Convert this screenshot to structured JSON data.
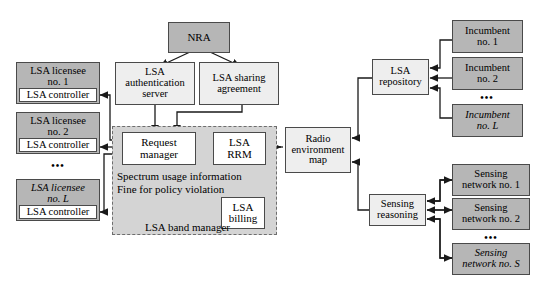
{
  "diagram": {
    "colors": {
      "shaded_fill": "#b6b6b6",
      "light_fill": "#eeeeee",
      "white_fill": "#ffffff",
      "band_region_fill": "#d4d4d4",
      "stroke": "#4a4a4a",
      "dashed_stroke": "#6d6d6d"
    },
    "nodes": {
      "nra": "NRA",
      "lsa_authentication_server": "LSA\nauthentication\nserver",
      "lsa_sharing_agreement": "LSA sharing\nagreement",
      "request_manager": "Request\nmanager",
      "lsa_rrm": "LSA\nRRM",
      "lsa_billing": "LSA\nbilling",
      "radio_environment_map": "Radio\nenvironment\nmap",
      "lsa_repository": "LSA\nrepository",
      "sensing_reasoning": "Sensing\nreasoning"
    },
    "licensees": [
      {
        "title": "LSA licensee\nno. 1",
        "controller": "LSA controller"
      },
      {
        "title": "LSA licensee\nno. 2",
        "controller": "LSA controller"
      },
      {
        "title": "LSA licensee\nno. L",
        "controller": "LSA controller"
      }
    ],
    "incumbents": [
      "Incumbent\nno. 1",
      "Incumbent\nno. 2",
      "Incumbent\nno. L"
    ],
    "sensing_networks": [
      "Sensing\nnetwork no. 1",
      "Sensing\nnetwork no. 2",
      "Sensing\nnetwork no. S"
    ],
    "band_region": {
      "label": "LSA band manager",
      "note_line_1": "Spectrum usage information",
      "note_line_2": "Fine for policy violation"
    },
    "ellipsis": "•••"
  }
}
